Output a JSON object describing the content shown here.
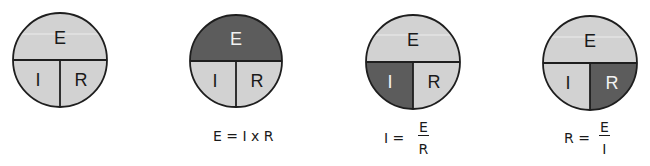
{
  "colors": {
    "light_fill": "#d2d2d2",
    "dark_fill": "#5c5c5c",
    "stroke": "#1e1e1e",
    "light_text": "#1a1a1a",
    "dark_text": "#f2f2f2"
  },
  "circles": [
    {
      "id": "base",
      "segments": {
        "top": "E",
        "bottom_left": "I",
        "bottom_right": "R"
      },
      "highlighted": null,
      "formula": null
    },
    {
      "id": "solve-e",
      "segments": {
        "top": "E",
        "bottom_left": "I",
        "bottom_right": "R"
      },
      "highlighted": "E",
      "formula": {
        "text": "E = I x R"
      }
    },
    {
      "id": "solve-i",
      "segments": {
        "top": "E",
        "bottom_left": "I",
        "bottom_right": "R"
      },
      "highlighted": "I",
      "formula": {
        "lhs": "I =",
        "numerator": "E",
        "denominator": "R"
      }
    },
    {
      "id": "solve-r",
      "segments": {
        "top": "E",
        "bottom_left": "I",
        "bottom_right": "R"
      },
      "highlighted": "R",
      "formula": {
        "lhs": "R =",
        "numerator": "E",
        "denominator": "I"
      }
    }
  ]
}
